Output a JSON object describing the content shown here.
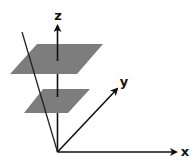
{
  "diagram": {
    "type": "3d-coordinate-axes-with-parallel-planes",
    "axes": {
      "x": {
        "label": "x"
      },
      "y": {
        "label": "y"
      },
      "z": {
        "label": "z"
      }
    },
    "planes": [
      {
        "name": "upper-plane",
        "color": "#7d7d7d"
      },
      {
        "name": "lower-plane",
        "color": "#7d7d7d"
      }
    ],
    "line": {
      "name": "slanted-line",
      "description": "line through origin intersecting both planes"
    },
    "colors": {
      "axis": "#111111",
      "plane": "#7d7d7d",
      "background": "#ffffff"
    }
  }
}
